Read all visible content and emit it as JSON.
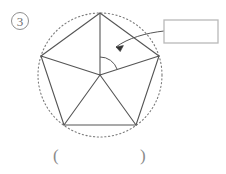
{
  "page": {
    "background_color": "#ffffff",
    "width": 226,
    "height": 174
  },
  "item": {
    "number_label": "3",
    "marker_name": "circled-number-3",
    "color": "#6f6f6f"
  },
  "figure": {
    "name": "regular-pentagon-inscribed-in-circle",
    "circle": {
      "center_x": 100,
      "center_y": 75,
      "radius": 62,
      "style": "dotted",
      "color": "#7a7a7a"
    },
    "polygon": {
      "sides": 5,
      "type": "regular-pentagon",
      "stroke_color": "#555555",
      "vertices": [
        {
          "label": "top",
          "x": 100,
          "y": 13
        },
        {
          "label": "upper-right",
          "x": 159,
          "y": 56
        },
        {
          "label": "lower-right",
          "x": 136,
          "y": 125
        },
        {
          "label": "lower-left",
          "x": 64,
          "y": 125
        },
        {
          "label": "upper-left",
          "x": 41,
          "y": 56
        }
      ]
    },
    "radii": {
      "count": 5,
      "description": "center to each vertex",
      "stroke_color": "#555555"
    },
    "angle_arc": {
      "name": "central-angle-arc",
      "between_vertices": [
        "top",
        "upper-right"
      ],
      "radius": 18,
      "color": "#555555"
    },
    "callout_arrow": {
      "name": "callout-arrow",
      "points_to": "central-angle-arc",
      "color": "#555555"
    }
  },
  "answer_box": {
    "name": "answer-box",
    "value": "",
    "placeholder": "",
    "x": 164,
    "y": 20,
    "width": 54,
    "height": 23,
    "border_color": "#b9b9b9"
  },
  "answer_parentheses": {
    "name": "answer-parentheses",
    "left": "(",
    "right": ")",
    "value": "",
    "color": "#8a8a8a"
  }
}
